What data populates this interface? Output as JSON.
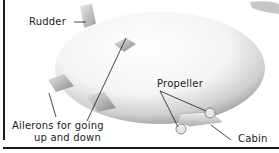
{
  "diagram": {
    "labels": {
      "rudder": "Rudder",
      "propeller": "Propeller",
      "ailerons_line1": "Ailerons for going",
      "ailerons_line2": "up and down",
      "cabin": "Cabin"
    },
    "colors": {
      "background": "#ffffff",
      "line": "#1a1a1a",
      "body_light": "#ffffff",
      "body_shade": "#9a9a9a"
    }
  }
}
